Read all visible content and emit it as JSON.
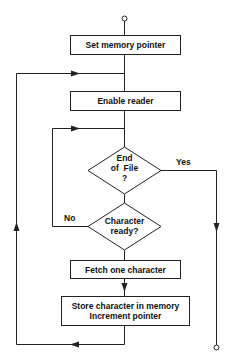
{
  "diagram": {
    "type": "flowchart",
    "nodes": {
      "start_terminal": {
        "shape": "circle",
        "label": ""
      },
      "set_pointer": {
        "shape": "process",
        "label": "Set memory pointer"
      },
      "enable_reader": {
        "shape": "process",
        "label": "Enable reader"
      },
      "eof_decision": {
        "shape": "decision",
        "line1": "End",
        "line2": "of  File",
        "line3": "?"
      },
      "char_ready_decision": {
        "shape": "decision",
        "line1": "Character",
        "line2": "ready?"
      },
      "fetch_char": {
        "shape": "process",
        "label": "Fetch one character"
      },
      "store_char": {
        "shape": "process",
        "line1": "Store character in memory",
        "line2": "Increment pointer"
      },
      "end_terminal": {
        "shape": "circle",
        "label": ""
      }
    },
    "edge_labels": {
      "yes": "Yes",
      "no": "No"
    },
    "edges": [
      {
        "from": "start_terminal",
        "to": "set_pointer"
      },
      {
        "from": "set_pointer",
        "to": "enable_reader"
      },
      {
        "from": "enable_reader",
        "to": "eof_decision"
      },
      {
        "from": "eof_decision",
        "to": "end_terminal",
        "label": "Yes"
      },
      {
        "from": "eof_decision",
        "to": "char_ready_decision"
      },
      {
        "from": "char_ready_decision",
        "to": "eof_decision",
        "label": "No"
      },
      {
        "from": "char_ready_decision",
        "to": "fetch_char"
      },
      {
        "from": "fetch_char",
        "to": "store_char"
      },
      {
        "from": "store_char",
        "to": "enable_reader"
      }
    ]
  }
}
